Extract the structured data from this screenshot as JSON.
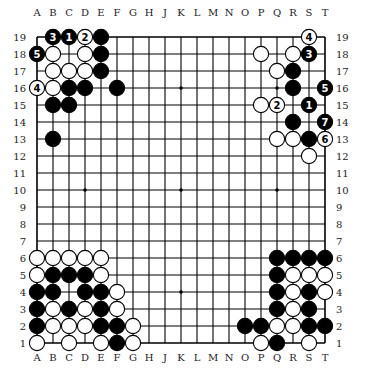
{
  "diagram": {
    "type": "go-board",
    "size": 19,
    "columns": [
      "A",
      "B",
      "C",
      "D",
      "E",
      "F",
      "G",
      "H",
      "J",
      "K",
      "L",
      "M",
      "N",
      "O",
      "P",
      "Q",
      "R",
      "S",
      "T"
    ],
    "rows": [
      "19",
      "18",
      "17",
      "16",
      "15",
      "14",
      "13",
      "12",
      "11",
      "10",
      "9",
      "8",
      "7",
      "6",
      "5",
      "4",
      "3",
      "2",
      "1"
    ],
    "star_points": [
      "D16",
      "K16",
      "Q16",
      "D10",
      "K10",
      "Q10",
      "D4",
      "K4",
      "Q4"
    ],
    "colors": {
      "board": "#ffffff",
      "lines": "#000000",
      "black_stone": "#000000",
      "white_stone": "#ffffff"
    },
    "stones": [
      {
        "pos": "B19",
        "color": "black",
        "label": "3"
      },
      {
        "pos": "C19",
        "color": "black",
        "label": "1"
      },
      {
        "pos": "D19",
        "color": "white",
        "label": "2"
      },
      {
        "pos": "E19",
        "color": "black"
      },
      {
        "pos": "A18",
        "color": "black",
        "label": "5"
      },
      {
        "pos": "B18",
        "color": "white"
      },
      {
        "pos": "D18",
        "color": "white"
      },
      {
        "pos": "E18",
        "color": "black"
      },
      {
        "pos": "B17",
        "color": "white"
      },
      {
        "pos": "C17",
        "color": "white"
      },
      {
        "pos": "D17",
        "color": "white"
      },
      {
        "pos": "E17",
        "color": "black"
      },
      {
        "pos": "A16",
        "color": "white",
        "label": "4"
      },
      {
        "pos": "B16",
        "color": "white"
      },
      {
        "pos": "C16",
        "color": "black"
      },
      {
        "pos": "D16",
        "color": "black"
      },
      {
        "pos": "F16",
        "color": "black"
      },
      {
        "pos": "B15",
        "color": "black"
      },
      {
        "pos": "C15",
        "color": "black"
      },
      {
        "pos": "B13",
        "color": "black"
      },
      {
        "pos": "S19",
        "color": "white",
        "label": "4"
      },
      {
        "pos": "P18",
        "color": "white"
      },
      {
        "pos": "R18",
        "color": "white"
      },
      {
        "pos": "S18",
        "color": "black",
        "label": "3"
      },
      {
        "pos": "Q17",
        "color": "white"
      },
      {
        "pos": "R17",
        "color": "black"
      },
      {
        "pos": "R16",
        "color": "black"
      },
      {
        "pos": "T16",
        "color": "black",
        "label": "5"
      },
      {
        "pos": "P15",
        "color": "white"
      },
      {
        "pos": "Q15",
        "color": "white",
        "label": "2"
      },
      {
        "pos": "S15",
        "color": "black",
        "label": "1"
      },
      {
        "pos": "R14",
        "color": "black"
      },
      {
        "pos": "T14",
        "color": "black",
        "label": "7"
      },
      {
        "pos": "Q13",
        "color": "white"
      },
      {
        "pos": "R13",
        "color": "white"
      },
      {
        "pos": "S13",
        "color": "black"
      },
      {
        "pos": "T13",
        "color": "white",
        "label": "6"
      },
      {
        "pos": "S12",
        "color": "white"
      },
      {
        "pos": "A6",
        "color": "white"
      },
      {
        "pos": "B6",
        "color": "white"
      },
      {
        "pos": "C6",
        "color": "white"
      },
      {
        "pos": "D6",
        "color": "white"
      },
      {
        "pos": "E6",
        "color": "white"
      },
      {
        "pos": "A5",
        "color": "white"
      },
      {
        "pos": "B5",
        "color": "black"
      },
      {
        "pos": "C5",
        "color": "black"
      },
      {
        "pos": "D5",
        "color": "black"
      },
      {
        "pos": "E5",
        "color": "white"
      },
      {
        "pos": "A4",
        "color": "black"
      },
      {
        "pos": "B4",
        "color": "black"
      },
      {
        "pos": "D4",
        "color": "black"
      },
      {
        "pos": "E4",
        "color": "black"
      },
      {
        "pos": "F4",
        "color": "white"
      },
      {
        "pos": "A3",
        "color": "black"
      },
      {
        "pos": "B3",
        "color": "white"
      },
      {
        "pos": "C3",
        "color": "black"
      },
      {
        "pos": "D3",
        "color": "white"
      },
      {
        "pos": "E3",
        "color": "black"
      },
      {
        "pos": "F3",
        "color": "white"
      },
      {
        "pos": "A2",
        "color": "black"
      },
      {
        "pos": "B2",
        "color": "white"
      },
      {
        "pos": "C2",
        "color": "white"
      },
      {
        "pos": "D2",
        "color": "white"
      },
      {
        "pos": "E2",
        "color": "black"
      },
      {
        "pos": "F2",
        "color": "black"
      },
      {
        "pos": "G2",
        "color": "white"
      },
      {
        "pos": "A1",
        "color": "white"
      },
      {
        "pos": "C1",
        "color": "white"
      },
      {
        "pos": "E1",
        "color": "white"
      },
      {
        "pos": "F1",
        "color": "black"
      },
      {
        "pos": "G1",
        "color": "white"
      },
      {
        "pos": "Q6",
        "color": "black"
      },
      {
        "pos": "R6",
        "color": "black"
      },
      {
        "pos": "S6",
        "color": "black"
      },
      {
        "pos": "T6",
        "color": "black"
      },
      {
        "pos": "Q5",
        "color": "black"
      },
      {
        "pos": "R5",
        "color": "white"
      },
      {
        "pos": "S5",
        "color": "white"
      },
      {
        "pos": "T5",
        "color": "white"
      },
      {
        "pos": "Q4",
        "color": "black"
      },
      {
        "pos": "R4",
        "color": "white"
      },
      {
        "pos": "S4",
        "color": "black"
      },
      {
        "pos": "T4",
        "color": "white"
      },
      {
        "pos": "Q3",
        "color": "black"
      },
      {
        "pos": "R3",
        "color": "white"
      },
      {
        "pos": "S3",
        "color": "black"
      },
      {
        "pos": "O2",
        "color": "black"
      },
      {
        "pos": "P2",
        "color": "black"
      },
      {
        "pos": "Q2",
        "color": "white"
      },
      {
        "pos": "R2",
        "color": "white"
      },
      {
        "pos": "S2",
        "color": "black"
      },
      {
        "pos": "T2",
        "color": "black"
      },
      {
        "pos": "P1",
        "color": "white"
      },
      {
        "pos": "Q1",
        "color": "black"
      },
      {
        "pos": "S1",
        "color": "white"
      }
    ]
  }
}
